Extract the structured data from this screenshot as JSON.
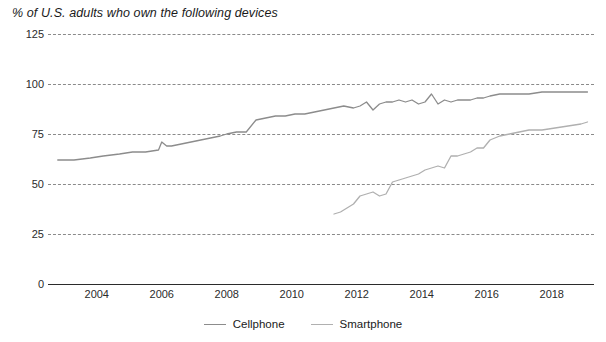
{
  "chart_data": {
    "type": "line",
    "title": "% of U.S. adults who own the following devices",
    "xlabel": "",
    "ylabel": "",
    "ylim": [
      0,
      125
    ],
    "xlim": [
      2002.5,
      2019.3
    ],
    "grid": true,
    "legend_position": "bottom",
    "yticks": [
      0,
      25,
      50,
      75,
      100,
      125
    ],
    "xticks": [
      2004,
      2006,
      2008,
      2010,
      2012,
      2014,
      2016,
      2018
    ],
    "colors": {
      "cellphone": "#8c8c8c",
      "smartphone": "#b0b0b0",
      "grid": "#8a8a8a",
      "axis": "#2b2b2b"
    },
    "series": [
      {
        "name": "Cellphone",
        "x": [
          2002.8,
          2003.3,
          2003.8,
          2004.2,
          2004.7,
          2005.1,
          2005.5,
          2005.9,
          2006.0,
          2006.15,
          2006.3,
          2006.6,
          2006.9,
          2007.2,
          2007.5,
          2007.8,
          2008.0,
          2008.3,
          2008.6,
          2008.9,
          2009.2,
          2009.5,
          2009.8,
          2010.1,
          2010.4,
          2010.7,
          2011.0,
          2011.3,
          2011.6,
          2011.9,
          2012.1,
          2012.3,
          2012.5,
          2012.7,
          2012.9,
          2013.1,
          2013.3,
          2013.5,
          2013.7,
          2013.9,
          2014.1,
          2014.3,
          2014.5,
          2014.7,
          2014.9,
          2015.1,
          2015.3,
          2015.5,
          2015.7,
          2015.9,
          2016.1,
          2016.4,
          2016.7,
          2017.0,
          2017.3,
          2017.7,
          2018.1,
          2018.5,
          2018.9,
          2019.1
        ],
        "y": [
          62,
          62,
          63,
          64,
          65,
          66,
          66,
          67,
          71,
          69,
          69,
          70,
          71,
          72,
          73,
          74,
          75,
          76,
          76,
          82,
          83,
          84,
          84,
          85,
          85,
          86,
          87,
          88,
          89,
          88,
          89,
          91,
          87,
          90,
          91,
          91,
          92,
          91,
          92,
          90,
          91,
          95,
          90,
          92,
          91,
          92,
          92,
          92,
          93,
          93,
          94,
          95,
          95,
          95,
          95,
          96,
          96,
          96,
          96,
          96
        ]
      },
      {
        "name": "Smartphone",
        "x": [
          2011.3,
          2011.5,
          2011.7,
          2011.9,
          2012.1,
          2012.3,
          2012.5,
          2012.7,
          2012.9,
          2013.1,
          2013.3,
          2013.5,
          2013.7,
          2013.9,
          2014.1,
          2014.3,
          2014.5,
          2014.7,
          2014.9,
          2015.1,
          2015.3,
          2015.5,
          2015.7,
          2015.9,
          2016.1,
          2016.4,
          2016.7,
          2017.0,
          2017.3,
          2017.7,
          2018.1,
          2018.5,
          2018.9,
          2019.1
        ],
        "y": [
          35,
          36,
          38,
          40,
          44,
          45,
          46,
          44,
          45,
          51,
          52,
          53,
          54,
          55,
          57,
          58,
          59,
          58,
          64,
          64,
          65,
          66,
          68,
          68,
          72,
          74,
          75,
          76,
          77,
          77,
          78,
          79,
          80,
          81
        ]
      }
    ]
  },
  "legend": [
    {
      "label": "Cellphone",
      "color": "#8c8c8c"
    },
    {
      "label": "Smartphone",
      "color": "#b0b0b0"
    }
  ]
}
